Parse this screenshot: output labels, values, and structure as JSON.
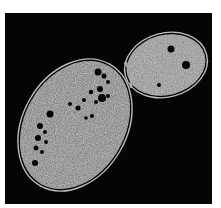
{
  "image": {
    "subject": "budding yeast cell micrograph",
    "colors": {
      "background": "#050505",
      "border": "#ffffff",
      "cytoplasm": "#8a8a8a",
      "wall": "#bdbdbd",
      "vacuole": "#000000"
    },
    "mother_cell": {
      "cx": 75,
      "cy": 125,
      "rx": 52,
      "ry": 70,
      "rotation": 30
    },
    "bud_cell": {
      "cx": 166,
      "cy": 65,
      "rx": 42,
      "ry": 32,
      "rotation": -15
    }
  }
}
